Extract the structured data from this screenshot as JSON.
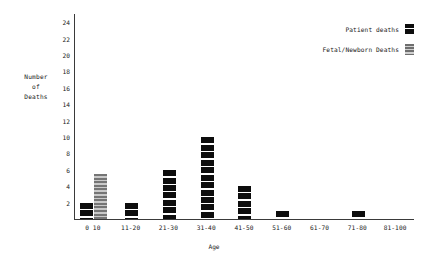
{
  "chart_data": {
    "type": "bar",
    "title": "",
    "xlabel": "Age",
    "ylabel": "Number of Deaths",
    "ylabel_lines": [
      "Number",
      "of",
      "Deaths"
    ],
    "categories": [
      "0 10",
      "11-20",
      "21-30",
      "31-40",
      "41-50",
      "51-60",
      "61-70",
      "71-80",
      "81-100"
    ],
    "series": [
      {
        "name": "Patient deaths",
        "color": "#0d0d0d",
        "values": [
          2,
          2,
          6,
          10,
          4,
          1,
          0,
          1,
          0
        ]
      },
      {
        "name": "Fetal/Newborn Deaths",
        "color": "#8f8f8f",
        "values": [
          5.5,
          0,
          0,
          0,
          0,
          0,
          0,
          0,
          0
        ]
      }
    ],
    "ylim": [
      0,
      25
    ],
    "yticks": [
      2,
      4,
      6,
      8,
      10,
      12,
      14,
      16,
      18,
      20,
      22,
      24
    ],
    "grid": false,
    "legend_position": "top-right"
  },
  "legend": {
    "entries": [
      {
        "label": "Patient deaths",
        "swatch": "patient-swatch"
      },
      {
        "label": "Fetal/Newborn Deaths",
        "swatch": "fetal-swatch"
      }
    ]
  }
}
